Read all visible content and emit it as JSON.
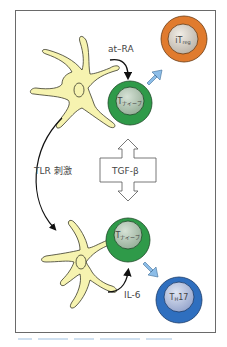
{
  "diagram": {
    "labels": {
      "at_ra": "at–RA",
      "tlr": "TLR 刺激",
      "tgf": "TGF-β",
      "il6": "IL-6"
    },
    "cells": {
      "treg": {
        "main": "iT",
        "sub": "reg",
        "outer": "#e07b2e",
        "inner": "#c9c2b8"
      },
      "naive_top": {
        "main": "T",
        "sub": "ナイーブ",
        "outer": "#2f9a49",
        "inner": "#a8bfa9"
      },
      "naive_bottom": {
        "main": "T",
        "sub": "ナイーブ",
        "outer": "#2f9a49",
        "inner": "#a8bfa9"
      },
      "th17": {
        "main": "T",
        "sub": "H",
        "suffix": "17",
        "outer": "#2f6fbf",
        "inner": "#a9b6d6"
      }
    },
    "colors": {
      "dendritic_cell_fill": "#f6f3b0",
      "blue_arrow": "#8cbde8",
      "frame": "#6a6a6a"
    }
  }
}
